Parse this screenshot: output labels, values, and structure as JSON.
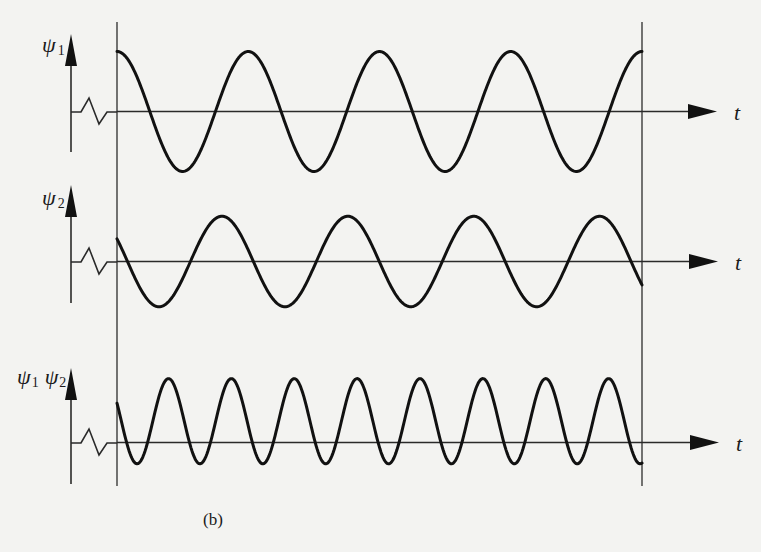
{
  "figure": {
    "caption": "(b)",
    "time_axis_label": "t",
    "panels": [
      {
        "id": "psi1",
        "label_main": "ψ",
        "label_sub": "1",
        "signal": "cos",
        "cycles_in_window": 4.0,
        "start_phase_deg": 0,
        "relative_amplitude": 1.0,
        "offset": 0
      },
      {
        "id": "psi2",
        "label_main": "ψ",
        "label_sub": "2",
        "signal": "cos",
        "cycles_in_window": 4.17,
        "start_phase_deg": 60,
        "relative_amplitude": 0.78,
        "offset": 0
      },
      {
        "id": "product",
        "label_main": "ψ",
        "label_sub": "1",
        "label_main2": "ψ",
        "label_sub2": "2",
        "signal": "cos",
        "cycles_in_window": 8.35,
        "start_phase_deg": 65,
        "relative_amplitude": 0.71,
        "offset": 0.5
      }
    ]
  }
}
